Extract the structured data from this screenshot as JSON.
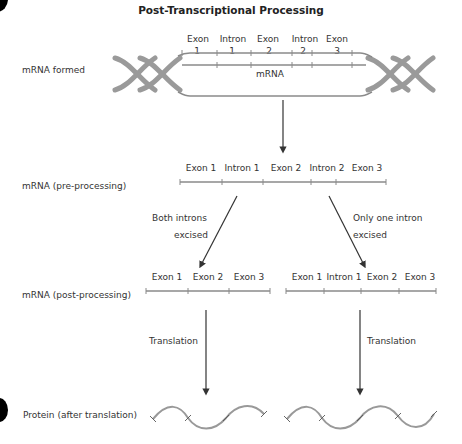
{
  "title": "Post-Transcriptional Processing",
  "rows": {
    "formed": {
      "label": "mRNA formed",
      "segments_top": [
        "Exon",
        "Intron",
        "Exon",
        "Intron",
        "Exon"
      ],
      "segments_num": [
        "1",
        "1",
        "2",
        "2",
        "3"
      ],
      "strand_label": "mRNA"
    },
    "pre": {
      "label": "mRNA (pre-processing)",
      "segments": [
        "Exon 1",
        "Intron 1",
        "Exon 2",
        "Intron 2",
        "Exon 3"
      ]
    },
    "branches": {
      "left": [
        "Both introns",
        "excised"
      ],
      "right": [
        "Only one intron",
        "excised"
      ]
    },
    "post": {
      "label": "mRNA (post-processing)",
      "left_segments": [
        "Exon 1",
        "Exon 2",
        "Exon 3"
      ],
      "right_segments": [
        "Exon 1",
        "Intron 1",
        "Exon 2",
        "Exon 3"
      ]
    },
    "translation": {
      "left": "Translation",
      "right": "Translation"
    },
    "protein": {
      "label": "Protein (after translation)"
    }
  },
  "colors": {
    "strand": "#8a8a8a",
    "helix": "#9a9a9a",
    "arrow": "#333333",
    "text": "#333333"
  }
}
